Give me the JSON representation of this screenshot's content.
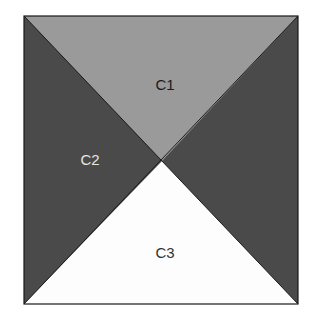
{
  "diagram": {
    "regions": [
      {
        "id": "C1",
        "label": "C1",
        "position": "top",
        "fill": "#9a9a9a",
        "text_color": "#1a1a1a"
      },
      {
        "id": "C2",
        "label": "C2",
        "position": "left-right",
        "fill": "#4a4a4a",
        "text_color": "#e6e6e6"
      },
      {
        "id": "C3",
        "label": "C3",
        "position": "bottom",
        "fill": "#fdfdfd",
        "text_color": "#333333"
      }
    ],
    "colors": {
      "border": "#1a1a1a",
      "background": "#ffffff"
    }
  }
}
